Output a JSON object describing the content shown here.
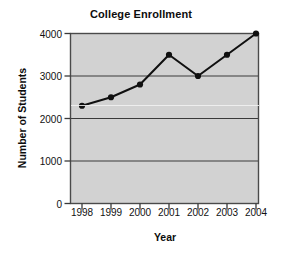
{
  "chart_data": {
    "type": "line",
    "title": "College Enrollment",
    "xlabel": "Year",
    "ylabel": "Number of Students",
    "categories": [
      "1998",
      "1999",
      "2000",
      "2001",
      "2002",
      "2003",
      "2004"
    ],
    "x": [
      1998,
      1999,
      2000,
      2001,
      2002,
      2003,
      2004
    ],
    "values": [
      2300,
      2500,
      2800,
      3500,
      3000,
      3500,
      4000
    ],
    "series": [
      {
        "name": "Number of Students",
        "values": [
          2300,
          2500,
          2800,
          3500,
          3000,
          3500,
          4000
        ]
      }
    ],
    "ylim": [
      0,
      4000
    ],
    "yticks": [
      0,
      1000,
      2000,
      3000,
      4000
    ],
    "ytick_labels": [
      "0",
      "1000",
      "2000",
      "3000",
      "4000"
    ],
    "xtick_labels": [
      "1998",
      "1999",
      "2000",
      "2001",
      "2002",
      "2003",
      "2004"
    ],
    "grid": true,
    "grid_axis": "y",
    "legend": false,
    "legend_position": "none",
    "marker": "filled-circle",
    "colors": {
      "line": "#101010",
      "marker": "#101010",
      "plot_background": "#d2d2d2",
      "grid": "#3a3a3a",
      "axis": "#4a4a4a",
      "text": "#0d0d0d",
      "figure_background": "#ffffff"
    }
  }
}
